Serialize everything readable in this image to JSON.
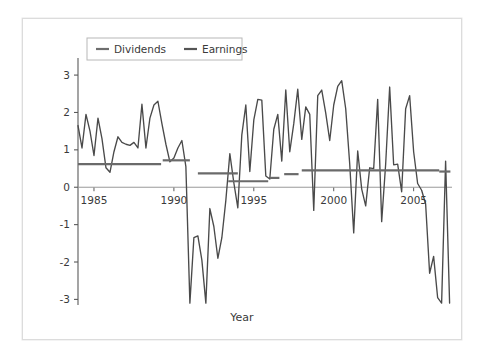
{
  "figure": {
    "background": "#ffffff",
    "frame_border_color": "#dcdcdc"
  },
  "chart_data": {
    "type": "line",
    "title": "",
    "subtitle": "",
    "xlabel": "Year",
    "ylabel": "Dollars per Share",
    "xlim": [
      1984.0,
      2007.4
    ],
    "ylim": [
      -3.15,
      3.35
    ],
    "xticks": [
      1985,
      1990,
      1995,
      2000,
      2005
    ],
    "xticklabels": [
      "1985",
      "1990",
      "1995",
      "2000",
      "2005"
    ],
    "yticks": [
      -3,
      -2,
      -1,
      0,
      1,
      2,
      3
    ],
    "yticklabels": [
      "-3",
      "-2",
      "-1",
      "0",
      "1",
      "2",
      "3"
    ],
    "grid": false,
    "zero_line": true,
    "legend": {
      "position": "upper-left",
      "boxed": true,
      "entries": [
        {
          "name": "Dividends",
          "color": "#6e6e6e",
          "linewidth": 2.2
        },
        {
          "name": "Earnings",
          "color": "#555555",
          "linewidth": 2.2
        }
      ]
    },
    "series": [
      {
        "name": "Earnings",
        "color": "#4a4a4a",
        "linewidth": 1.35,
        "x": [
          1984.0,
          1984.25,
          1984.5,
          1984.75,
          1985.0,
          1985.25,
          1985.5,
          1985.75,
          1986.0,
          1986.25,
          1986.5,
          1986.75,
          1987.0,
          1987.25,
          1987.5,
          1987.75,
          1988.0,
          1988.25,
          1988.5,
          1988.75,
          1989.0,
          1989.25,
          1989.5,
          1989.75,
          1990.0,
          1990.25,
          1990.5,
          1990.75,
          1991.0,
          1991.25,
          1991.5,
          1991.75,
          1992.0,
          1992.25,
          1992.5,
          1992.75,
          1993.0,
          1993.25,
          1993.5,
          1993.75,
          1994.0,
          1994.25,
          1994.5,
          1994.75,
          1995.0,
          1995.25,
          1995.5,
          1995.75,
          1996.0,
          1996.25,
          1996.5,
          1996.75,
          1997.0,
          1997.25,
          1997.5,
          1997.75,
          1998.0,
          1998.25,
          1998.5,
          1998.75,
          1999.0,
          1999.25,
          1999.5,
          1999.75,
          2000.0,
          2000.25,
          2000.5,
          2000.75,
          2001.0,
          2001.25,
          2001.5,
          2001.75,
          2002.0,
          2002.25,
          2002.5,
          2002.75,
          2003.0,
          2003.25,
          2003.5,
          2003.75,
          2004.0,
          2004.25,
          2004.5,
          2004.75,
          2005.0,
          2005.25,
          2005.5,
          2005.75,
          2006.0,
          2006.25,
          2006.5,
          2006.75,
          2007.0,
          2007.25
        ],
        "values": [
          1.65,
          1.05,
          1.95,
          1.5,
          0.85,
          1.85,
          1.3,
          0.52,
          0.4,
          0.95,
          1.35,
          1.2,
          1.15,
          1.12,
          1.2,
          1.05,
          2.22,
          1.05,
          1.85,
          2.2,
          2.3,
          1.7,
          1.15,
          0.68,
          0.78,
          1.05,
          1.25,
          0.55,
          -3.1,
          -1.35,
          -1.3,
          -1.95,
          -3.1,
          -0.57,
          -1.05,
          -1.9,
          -1.35,
          -0.35,
          0.9,
          0.12,
          -0.55,
          1.4,
          2.2,
          0.42,
          1.8,
          2.35,
          2.33,
          0.3,
          0.22,
          1.55,
          1.95,
          0.7,
          2.6,
          0.95,
          1.7,
          2.62,
          1.28,
          2.15,
          1.95,
          -0.62,
          2.45,
          2.6,
          1.98,
          1.25,
          2.2,
          2.7,
          2.85,
          2.1,
          0.62,
          -1.22,
          0.97,
          -0.05,
          -0.5,
          0.52,
          0.5,
          2.35,
          -0.92,
          0.62,
          2.68,
          0.6,
          0.62,
          -0.12,
          2.1,
          2.45,
          0.95,
          0.1,
          -0.08,
          -0.45,
          -2.3,
          -1.85,
          -2.95,
          -3.1,
          0.7,
          -3.1
        ]
      },
      {
        "name": "Dividends",
        "color": "#6a6a6a",
        "linewidth": 2.2,
        "steps": [
          {
            "x0": 1984.0,
            "x1": 1989.2,
            "y": 0.62
          },
          {
            "x0": 1989.3,
            "x1": 1991.0,
            "y": 0.72
          },
          {
            "x0": 1991.5,
            "x1": 1994.0,
            "y": 0.37
          },
          {
            "x0": 1993.4,
            "x1": 1995.9,
            "y": 0.16
          },
          {
            "x0": 1996.0,
            "x1": 1996.6,
            "y": 0.25
          },
          {
            "x0": 1996.9,
            "x1": 1997.8,
            "y": 0.35
          },
          {
            "x0": 1998.0,
            "x1": 2006.6,
            "y": 0.45
          },
          {
            "x0": 2006.6,
            "x1": 2007.3,
            "y": 0.42
          }
        ]
      }
    ]
  },
  "axis": {
    "y_title": "Dollars per Share",
    "x_title": "Year"
  }
}
